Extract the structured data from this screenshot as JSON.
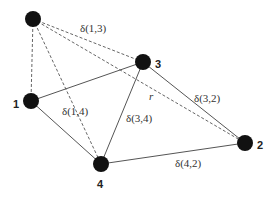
{
  "diagram": {
    "type": "graph",
    "nodes": [
      {
        "id": "top",
        "label": "",
        "x": 33,
        "y": 19
      },
      {
        "id": "1",
        "label": "1",
        "x": 31,
        "y": 101
      },
      {
        "id": "2",
        "label": "2",
        "x": 245,
        "y": 143
      },
      {
        "id": "3",
        "label": "3",
        "x": 143,
        "y": 62
      },
      {
        "id": "4",
        "label": "4",
        "x": 101,
        "y": 164
      }
    ],
    "edges": [
      {
        "from": "1",
        "to": "3",
        "style": "solid",
        "label": ""
      },
      {
        "from": "1",
        "to": "4",
        "style": "solid",
        "label": ""
      },
      {
        "from": "3",
        "to": "4",
        "style": "solid",
        "label": "δ(3,4)"
      },
      {
        "from": "3",
        "to": "2",
        "style": "solid",
        "label": "δ(3,2)"
      },
      {
        "from": "4",
        "to": "2",
        "style": "solid",
        "label": "δ(4,2)"
      },
      {
        "from": "top",
        "to": "1",
        "style": "dashed",
        "label": ""
      },
      {
        "from": "top",
        "to": "3",
        "style": "dashed",
        "label": "δ(1,3)"
      },
      {
        "from": "top",
        "to": "4",
        "style": "dashed",
        "label": "δ(1,4)"
      },
      {
        "from": "top",
        "to": "2",
        "style": "dashed",
        "label": "r"
      }
    ],
    "node_labels": {
      "n1": "1",
      "n2": "2",
      "n3": "3",
      "n4": "4"
    },
    "edge_labels": {
      "d13": "δ(1,3)",
      "d14": "δ(1,4)",
      "d34": "δ(3,4)",
      "d32": "δ(3,2)",
      "d42": "δ(4,2)",
      "r": "r"
    },
    "colors": {
      "node": "#111111",
      "edge": "#555555",
      "text": "#333333"
    }
  }
}
